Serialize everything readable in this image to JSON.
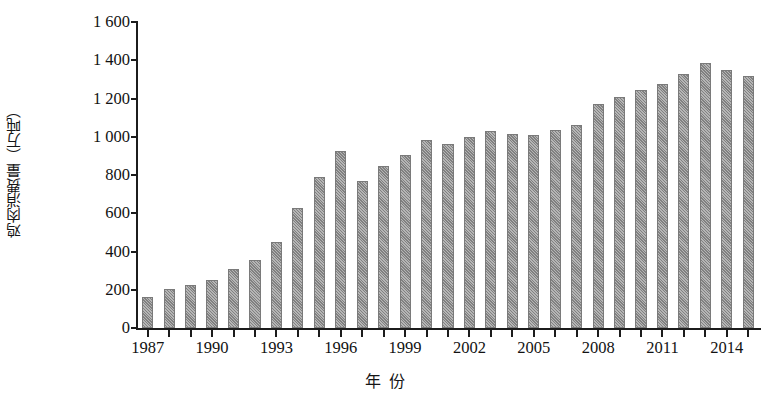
{
  "chart_data": {
    "type": "bar",
    "title": "",
    "xlabel": "年  份",
    "ylabel": "鸡肉消费量（万吨）",
    "ylim": [
      0,
      1600
    ],
    "ytick_values": [
      0,
      200,
      400,
      600,
      800,
      1000,
      1200,
      1400,
      1600
    ],
    "ytick_labels": [
      "0",
      "200",
      "400",
      "600",
      "800",
      "1 000",
      "1 200",
      "1 400",
      "1 600"
    ],
    "grid": false,
    "legend": "none",
    "bar_color": "#8f8f8f",
    "bar_edge_color": "#7a7a7a",
    "axis_color": "#1c1c1c",
    "categories": [
      "1987",
      "1988",
      "1989",
      "1990",
      "1991",
      "1992",
      "1993",
      "1994",
      "1995",
      "1996",
      "1997",
      "1998",
      "1999",
      "2000",
      "2001",
      "2002",
      "2003",
      "2004",
      "2005",
      "2006",
      "2007",
      "2008",
      "2009",
      "2010",
      "2011",
      "2012",
      "2013",
      "2014",
      "2015"
    ],
    "values": [
      160,
      205,
      225,
      250,
      310,
      355,
      450,
      630,
      790,
      925,
      770,
      845,
      905,
      985,
      960,
      1000,
      1030,
      1015,
      1010,
      1035,
      1060,
      1170,
      1210,
      1245,
      1275,
      1330,
      1385,
      1350,
      1320
    ],
    "xtick_labels_shown": [
      "1987",
      "1990",
      "1993",
      "1996",
      "1999",
      "2002",
      "2005",
      "2008",
      "2011",
      "2014"
    ]
  }
}
